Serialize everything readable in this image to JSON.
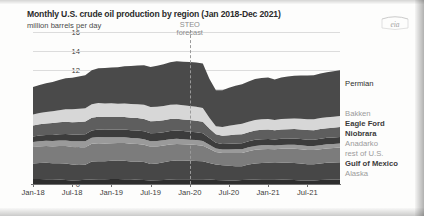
{
  "header": {
    "title": "Monthly U.S. crude oil production by region (Jan 2018-Dec 2021)",
    "subtitle": "million barrels per day",
    "logo_text": "eia"
  },
  "annotation": {
    "steo_line1": "STEO",
    "steo_line2": "forecast",
    "forecast_start_x": "2020-01"
  },
  "colors": {
    "permian": "#4a4a4a",
    "bakken": "#d7d7d7",
    "eagle_ford": "#5e5e5e",
    "niobrara": "#3c3c3c",
    "anadarko": "#9a9a9a",
    "rest_of_us": "#7c7c7c",
    "gulf_of_mexico": "#474747",
    "alaska": "#2e2e2e",
    "gridline": "#dcdcdc",
    "axis": "#6f6f6f",
    "text_dark": "#2d2d2d",
    "text_light": "#9b9b9b"
  },
  "legend": [
    {
      "label": "Permian",
      "weight": "normal",
      "tone": "dark",
      "y": 83
    },
    {
      "label": "Bakken",
      "weight": "normal",
      "tone": "light",
      "y": 113
    },
    {
      "label": "Eagle Ford",
      "weight": "bold",
      "tone": "dark",
      "y": 123
    },
    {
      "label": "Niobrara",
      "weight": "bold",
      "tone": "dark",
      "y": 133
    },
    {
      "label": "Anadarko",
      "weight": "normal",
      "tone": "light",
      "y": 143
    },
    {
      "label": "rest of U.S.",
      "weight": "normal",
      "tone": "light",
      "y": 153
    },
    {
      "label": "Gulf of Mexico",
      "weight": "bold",
      "tone": "dark",
      "y": 163
    },
    {
      "label": "Alaska",
      "weight": "normal",
      "tone": "light",
      "y": 173
    }
  ],
  "chart_data": {
    "type": "area",
    "stacked": true,
    "title": "Monthly U.S. crude oil production by region (Jan 2018-Dec 2021)",
    "subtitle": "million barrels per day",
    "xlabel": "",
    "ylabel": "million barrels per day",
    "ylim": [
      0,
      16
    ],
    "yticks": [
      0,
      2,
      4,
      6,
      8,
      10,
      12,
      14,
      16
    ],
    "grid": true,
    "legend_position": "right",
    "xticks": [
      "Jan-18",
      "Jul-18",
      "Jan-19",
      "Jul-19",
      "Jan-20",
      "Jul-20",
      "Jan-21",
      "Jul-21"
    ],
    "x": [
      "2018-01",
      "2018-02",
      "2018-03",
      "2018-04",
      "2018-05",
      "2018-06",
      "2018-07",
      "2018-08",
      "2018-09",
      "2018-10",
      "2018-11",
      "2018-12",
      "2019-01",
      "2019-02",
      "2019-03",
      "2019-04",
      "2019-05",
      "2019-06",
      "2019-07",
      "2019-08",
      "2019-09",
      "2019-10",
      "2019-11",
      "2019-12",
      "2020-01",
      "2020-02",
      "2020-03",
      "2020-04",
      "2020-05",
      "2020-06",
      "2020-07",
      "2020-08",
      "2020-09",
      "2020-10",
      "2020-11",
      "2020-12",
      "2021-01",
      "2021-02",
      "2021-03",
      "2021-04",
      "2021-05",
      "2021-06",
      "2021-07",
      "2021-08",
      "2021-09",
      "2021-10",
      "2021-11",
      "2021-12"
    ],
    "series": [
      {
        "name": "Alaska",
        "color": "#2e2e2e",
        "values": [
          0.52,
          0.52,
          0.51,
          0.5,
          0.47,
          0.42,
          0.38,
          0.39,
          0.44,
          0.48,
          0.5,
          0.51,
          0.52,
          0.52,
          0.51,
          0.49,
          0.45,
          0.41,
          0.38,
          0.39,
          0.43,
          0.47,
          0.5,
          0.51,
          0.5,
          0.5,
          0.49,
          0.47,
          0.43,
          0.39,
          0.37,
          0.38,
          0.42,
          0.46,
          0.48,
          0.49,
          0.49,
          0.49,
          0.48,
          0.46,
          0.42,
          0.38,
          0.36,
          0.37,
          0.41,
          0.45,
          0.47,
          0.48
        ]
      },
      {
        "name": "Gulf of Mexico",
        "color": "#474747",
        "values": [
          1.65,
          1.7,
          1.72,
          1.68,
          1.72,
          1.75,
          1.68,
          1.62,
          1.58,
          1.88,
          1.9,
          1.88,
          1.92,
          1.95,
          1.94,
          1.89,
          1.92,
          1.9,
          1.73,
          1.78,
          1.85,
          1.95,
          1.98,
          1.96,
          1.95,
          1.93,
          1.9,
          1.75,
          1.62,
          1.58,
          1.55,
          1.5,
          1.45,
          1.58,
          1.68,
          1.72,
          1.74,
          1.72,
          1.76,
          1.78,
          1.8,
          1.78,
          1.72,
          1.7,
          1.74,
          1.78,
          1.8,
          1.82
        ]
      },
      {
        "name": "rest of U.S.",
        "color": "#7c7c7c",
        "values": [
          1.72,
          1.74,
          1.76,
          1.78,
          1.8,
          1.82,
          1.84,
          1.86,
          1.85,
          1.88,
          1.9,
          1.88,
          1.86,
          1.84,
          1.86,
          1.85,
          1.84,
          1.82,
          1.8,
          1.78,
          1.76,
          1.75,
          1.74,
          1.72,
          1.7,
          1.68,
          1.64,
          1.48,
          1.32,
          1.3,
          1.34,
          1.38,
          1.4,
          1.42,
          1.44,
          1.45,
          1.46,
          1.44,
          1.46,
          1.47,
          1.48,
          1.49,
          1.5,
          1.5,
          1.51,
          1.52,
          1.52,
          1.53
        ]
      },
      {
        "name": "Anadarko",
        "color": "#9a9a9a",
        "values": [
          0.52,
          0.54,
          0.55,
          0.57,
          0.58,
          0.6,
          0.61,
          0.62,
          0.63,
          0.64,
          0.65,
          0.64,
          0.63,
          0.62,
          0.62,
          0.61,
          0.6,
          0.59,
          0.58,
          0.57,
          0.56,
          0.55,
          0.54,
          0.53,
          0.52,
          0.51,
          0.5,
          0.43,
          0.38,
          0.37,
          0.38,
          0.39,
          0.4,
          0.4,
          0.41,
          0.41,
          0.41,
          0.4,
          0.41,
          0.41,
          0.42,
          0.42,
          0.42,
          0.42,
          0.43,
          0.43,
          0.43,
          0.44
        ]
      },
      {
        "name": "Niobrara",
        "color": "#3c3c3c",
        "values": [
          0.58,
          0.6,
          0.62,
          0.64,
          0.66,
          0.68,
          0.7,
          0.72,
          0.74,
          0.76,
          0.78,
          0.79,
          0.8,
          0.8,
          0.81,
          0.82,
          0.83,
          0.84,
          0.84,
          0.85,
          0.85,
          0.86,
          0.86,
          0.85,
          0.84,
          0.83,
          0.82,
          0.7,
          0.6,
          0.58,
          0.6,
          0.62,
          0.63,
          0.64,
          0.65,
          0.65,
          0.65,
          0.64,
          0.65,
          0.65,
          0.66,
          0.66,
          0.67,
          0.67,
          0.68,
          0.68,
          0.68,
          0.69
        ]
      },
      {
        "name": "Eagle Ford",
        "color": "#5e5e5e",
        "values": [
          1.18,
          1.2,
          1.22,
          1.24,
          1.26,
          1.28,
          1.3,
          1.32,
          1.33,
          1.34,
          1.35,
          1.34,
          1.33,
          1.32,
          1.32,
          1.31,
          1.3,
          1.29,
          1.28,
          1.27,
          1.26,
          1.25,
          1.24,
          1.23,
          1.22,
          1.21,
          1.2,
          1.02,
          0.88,
          0.86,
          0.9,
          0.93,
          0.95,
          0.96,
          0.97,
          0.98,
          0.98,
          0.96,
          0.98,
          0.99,
          1.0,
          1.0,
          1.01,
          1.01,
          1.02,
          1.02,
          1.03,
          1.03
        ]
      },
      {
        "name": "Bakken",
        "color": "#d7d7d7",
        "values": [
          1.15,
          1.18,
          1.2,
          1.24,
          1.28,
          1.32,
          1.35,
          1.38,
          1.4,
          1.42,
          1.45,
          1.44,
          1.43,
          1.4,
          1.42,
          1.44,
          1.46,
          1.48,
          1.49,
          1.5,
          1.51,
          1.52,
          1.52,
          1.5,
          1.48,
          1.46,
          1.44,
          1.12,
          0.86,
          0.92,
          1.0,
          1.05,
          1.08,
          1.1,
          1.12,
          1.12,
          1.12,
          1.08,
          1.1,
          1.11,
          1.12,
          1.13,
          1.14,
          1.14,
          1.15,
          1.15,
          1.16,
          1.16
        ]
      },
      {
        "name": "Permian",
        "color": "#4a4a4a",
        "values": [
          2.88,
          2.95,
          3.02,
          3.1,
          3.18,
          3.25,
          3.32,
          3.4,
          3.48,
          3.58,
          3.66,
          3.72,
          3.78,
          3.84,
          3.92,
          4.0,
          4.08,
          4.16,
          4.22,
          4.3,
          4.38,
          4.46,
          4.54,
          4.58,
          4.62,
          4.66,
          4.7,
          4.1,
          3.78,
          3.86,
          4.0,
          4.1,
          4.18,
          4.24,
          4.3,
          4.34,
          4.36,
          4.26,
          4.38,
          4.44,
          4.5,
          4.56,
          4.6,
          4.64,
          4.7,
          4.74,
          4.78,
          4.82
        ]
      }
    ],
    "totals_note": "Stacked total peaks near 13 million barrels per day in early 2020 and again at end of 2021"
  }
}
